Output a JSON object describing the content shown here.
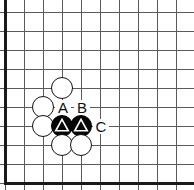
{
  "diagram": {
    "board": {
      "width": 194,
      "height": 190,
      "cell_size": 19,
      "origin_x": 5,
      "origin_y": 12,
      "columns": 10,
      "rows": 10,
      "line_color": "#5a5a5a",
      "edge_color": "#1a1a1a",
      "background_color": "#ffffff",
      "edges_shown": [
        "left",
        "bottom"
      ]
    },
    "stone_radius": 11,
    "stones": [
      {
        "id": "w1",
        "color": "white",
        "col": 3,
        "row": 4,
        "marker": "none"
      },
      {
        "id": "w2",
        "color": "white",
        "col": 2,
        "row": 5,
        "marker": "none"
      },
      {
        "id": "w3",
        "color": "white",
        "col": 2,
        "row": 6,
        "marker": "none"
      },
      {
        "id": "b1",
        "color": "black",
        "col": 3,
        "row": 6,
        "marker": "triangle"
      },
      {
        "id": "b2",
        "color": "black",
        "col": 4,
        "row": 6,
        "marker": "triangle"
      },
      {
        "id": "w4",
        "color": "white",
        "col": 3,
        "row": 7,
        "marker": "none"
      },
      {
        "id": "w5",
        "color": "white",
        "col": 4,
        "row": 7,
        "marker": "none"
      }
    ],
    "labels": [
      {
        "id": "label-a",
        "text": "A",
        "col": 3,
        "row": 5
      },
      {
        "id": "label-b",
        "text": "B",
        "col": 4,
        "row": 5
      },
      {
        "id": "label-c",
        "text": "C",
        "col": 5,
        "row": 6
      }
    ],
    "colors": {
      "black_stone": "#050505",
      "white_stone": "#ffffff",
      "marker_stroke": "#ffffff",
      "label_text": "#111111"
    }
  }
}
